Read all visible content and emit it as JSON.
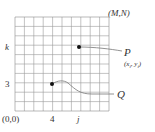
{
  "diagram": {
    "grid": {
      "cols": 10,
      "rows": 10,
      "left": 15,
      "top": 17,
      "cell": 9.4,
      "line_color": "#9a9a9a",
      "border_color": "#8a8a8a"
    },
    "corner_origin_label": "(0,0)",
    "corner_max_label": "(M,N)",
    "x_tick_labels": [
      {
        "text": "4",
        "col": 4
      },
      {
        "text": "j",
        "col": 7,
        "italic": true
      }
    ],
    "y_tick_labels": [
      {
        "text": "3",
        "row": 3
      },
      {
        "text": "k",
        "row": 7,
        "italic": true
      }
    ],
    "points": [
      {
        "name": "P",
        "label": "P",
        "coord_label_x": "x",
        "coord_label_x_sub": "i",
        "coord_label_y": "y",
        "coord_label_y_sub": "i",
        "col": 7,
        "row": 7
      },
      {
        "name": "Q",
        "label": "Q",
        "col": 4,
        "row": 3
      }
    ],
    "colors": {
      "dot": "#111111",
      "curve": "#777777",
      "text": "#333333"
    }
  }
}
